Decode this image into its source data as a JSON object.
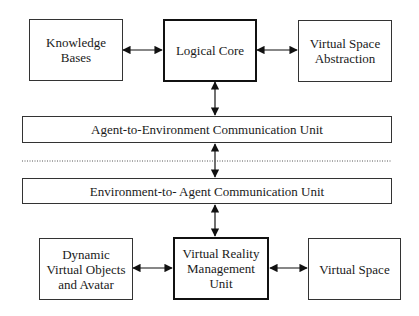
{
  "diagram": {
    "top_row": {
      "knowledge_bases": "Knowledge\nBases",
      "logical_core": "Logical Core",
      "virtual_space_abstraction": "Virtual Space\nAbstraction"
    },
    "bars": {
      "agent_to_environment": "Agent-to-Environment Communication Unit",
      "environment_to_agent": "Environment-to- Agent Communication Unit"
    },
    "bottom_row": {
      "dynamic_objects": "Dynamic\nVirtual Objects\nand Avatar",
      "vr_management": "Virtual Reality\nManagement\nUnit",
      "virtual_space": "Virtual Space"
    },
    "connections": [
      {
        "from": "Knowledge Bases",
        "to": "Logical Core",
        "type": "bidirectional"
      },
      {
        "from": "Logical Core",
        "to": "Virtual Space Abstraction",
        "type": "bidirectional"
      },
      {
        "from": "Logical Core",
        "to": "Agent-to-Environment Communication Unit",
        "type": "bidirectional"
      },
      {
        "from": "Agent-to-Environment Communication Unit",
        "to": "Environment-to- Agent Communication Unit",
        "type": "bidirectional"
      },
      {
        "from": "Environment-to- Agent Communication Unit",
        "to": "Virtual Reality Management Unit",
        "type": "bidirectional"
      },
      {
        "from": "Dynamic Virtual Objects and Avatar",
        "to": "Virtual Reality Management Unit",
        "type": "bidirectional"
      },
      {
        "from": "Virtual Reality Management Unit",
        "to": "Virtual Space",
        "type": "bidirectional"
      }
    ],
    "separator": "dotted"
  }
}
